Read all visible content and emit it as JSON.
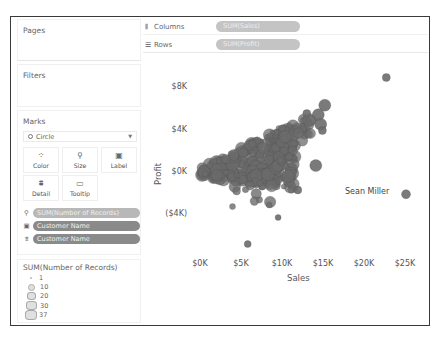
{
  "panels": {
    "pages_title": "Pages",
    "filters_title": "Filters",
    "marks_title": "Marks",
    "mark_type": "Circle",
    "mark_buttons": [
      {
        "label": "Color",
        "icon": "color-dots-icon"
      },
      {
        "label": "Size",
        "icon": "size-icon"
      },
      {
        "label": "Label",
        "icon": "label-icon"
      },
      {
        "label": "Detail",
        "icon": "detail-icon"
      },
      {
        "label": "Tooltip",
        "icon": "tooltip-icon"
      }
    ],
    "mark_pills": [
      {
        "icon": "size-icon",
        "label": "SUM(Number of Records)",
        "style": "light"
      },
      {
        "icon": "label-icon",
        "label": "Customer Name",
        "style": "dark"
      },
      {
        "icon": "detail-icon",
        "label": "Customer Name",
        "style": "dark"
      }
    ],
    "legend": {
      "title": "SUM(Number of Records)",
      "items": [
        "1",
        "10",
        "20",
        "30",
        "37"
      ]
    }
  },
  "shelves": {
    "columns_label": "Columns",
    "columns_pill": "SUM(Sales)",
    "rows_label": "Rows",
    "rows_pill": "SUM(Profit)"
  },
  "chart_data": {
    "type": "scatter",
    "title": "",
    "xlabel": "Sales",
    "ylabel": "Profit",
    "x_ticks": [
      "$0K",
      "$5K",
      "$10K",
      "$15K",
      "$20K",
      "$25K"
    ],
    "y_ticks": [
      "$8K",
      "$4K",
      "$0K",
      "($4K)"
    ],
    "xlim": [
      0,
      25000
    ],
    "ylim": [
      -6800,
      10000
    ],
    "mark": "circle",
    "size_by": "SUM(Number of Records)",
    "label_by": "Customer Name",
    "annotations": [
      {
        "label": "Sean Miller",
        "x": 25000,
        "y": -2000
      }
    ],
    "color": "#6b6b6b",
    "outlier_points": [
      {
        "x": 22600,
        "y": 9000,
        "r": 4
      },
      {
        "x": 15100,
        "y": 6400,
        "r": 6
      },
      {
        "x": 12900,
        "y": 5600,
        "r": 4
      },
      {
        "x": 14300,
        "y": 5500,
        "r": 6
      },
      {
        "x": 14600,
        "y": 4600,
        "r": 6
      },
      {
        "x": 14800,
        "y": 4000,
        "r": 4
      },
      {
        "x": 14000,
        "y": 700,
        "r": 6
      },
      {
        "x": 11800,
        "y": -1600,
        "r": 4
      },
      {
        "x": 25000,
        "y": -2000,
        "r": 4.5
      },
      {
        "x": 9400,
        "y": -4200,
        "r": 3
      },
      {
        "x": 5700,
        "y": -6700,
        "r": 3.5
      }
    ]
  }
}
